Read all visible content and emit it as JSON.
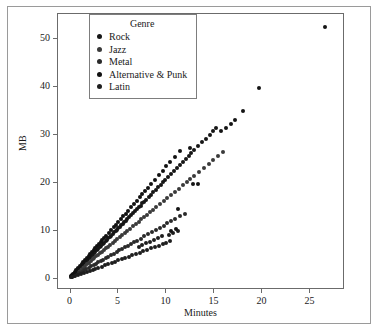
{
  "chart_data": {
    "type": "scatter",
    "title": "",
    "xlabel": "Minutes",
    "ylabel": "MB",
    "xlim": [
      -1.2,
      28.5
    ],
    "ylim": [
      -2.0,
      55.0
    ],
    "xticks": [
      0,
      5,
      10,
      15,
      20,
      25
    ],
    "yticks": [
      0,
      10,
      20,
      30,
      40,
      50
    ],
    "grid": false,
    "legend": {
      "title": "Genre",
      "position": "upper-left-inside",
      "entries": [
        {
          "label": "Rock",
          "color": "#161616"
        },
        {
          "label": "Jazz",
          "color": "#3a3a3a"
        },
        {
          "label": "Metal",
          "color": "#2a2a2a"
        },
        {
          "label": "Alternative & Punk",
          "color": "#111111"
        },
        {
          "label": "Latin",
          "color": "#1e1e1e"
        }
      ]
    },
    "series": [
      {
        "name": "Rock",
        "color": "#161616",
        "points": [
          [
            0.15,
            0.3
          ],
          [
            0.3,
            0.62
          ],
          [
            0.45,
            0.92
          ],
          [
            0.6,
            1.22
          ],
          [
            0.75,
            1.55
          ],
          [
            0.9,
            1.85
          ],
          [
            1.05,
            2.15
          ],
          [
            1.2,
            2.45
          ],
          [
            1.35,
            2.78
          ],
          [
            1.5,
            3.08
          ],
          [
            1.65,
            3.38
          ],
          [
            1.8,
            3.7
          ],
          [
            1.95,
            4.0
          ],
          [
            2.1,
            4.3
          ],
          [
            2.25,
            4.62
          ],
          [
            2.4,
            4.92
          ],
          [
            2.55,
            5.22
          ],
          [
            2.7,
            5.55
          ],
          [
            2.85,
            5.85
          ],
          [
            3.0,
            6.15
          ],
          [
            3.15,
            6.45
          ],
          [
            3.3,
            6.78
          ],
          [
            3.45,
            7.08
          ],
          [
            3.6,
            7.38
          ],
          [
            3.75,
            7.7
          ],
          [
            3.9,
            8.0
          ],
          [
            4.05,
            8.3
          ],
          [
            4.2,
            8.62
          ],
          [
            4.35,
            8.92
          ],
          [
            4.5,
            9.22
          ],
          [
            4.65,
            9.55
          ],
          [
            4.8,
            9.85
          ],
          [
            4.95,
            10.15
          ],
          [
            5.1,
            10.45
          ],
          [
            5.25,
            10.78
          ],
          [
            5.4,
            11.08
          ],
          [
            5.55,
            11.38
          ],
          [
            5.7,
            11.7
          ],
          [
            5.85,
            12.0
          ],
          [
            6.0,
            12.3
          ],
          [
            6.2,
            12.7
          ],
          [
            6.4,
            13.1
          ],
          [
            6.6,
            13.52
          ],
          [
            6.8,
            13.92
          ],
          [
            7.0,
            14.34
          ],
          [
            7.2,
            14.75
          ],
          [
            7.4,
            15.15
          ],
          [
            7.6,
            15.58
          ],
          [
            7.8,
            15.98
          ],
          [
            8.0,
            16.4
          ],
          [
            8.25,
            16.9
          ],
          [
            8.5,
            17.42
          ],
          [
            8.75,
            17.92
          ],
          [
            9.0,
            18.45
          ],
          [
            9.25,
            18.95
          ],
          [
            9.5,
            19.48
          ],
          [
            9.75,
            19.98
          ],
          [
            10.0,
            20.5
          ],
          [
            10.3,
            21.1
          ],
          [
            10.6,
            21.72
          ],
          [
            10.9,
            22.35
          ],
          [
            11.2,
            22.95
          ],
          [
            11.5,
            23.58
          ],
          [
            11.8,
            24.18
          ],
          [
            12.1,
            24.8
          ],
          [
            12.4,
            25.42
          ],
          [
            12.7,
            26.02
          ],
          [
            13.0,
            26.65
          ],
          [
            13.4,
            27.45
          ],
          [
            13.8,
            28.3
          ],
          [
            14.2,
            29.1
          ],
          [
            14.6,
            29.92
          ],
          [
            15.0,
            30.72
          ],
          [
            15.3,
            31.35
          ]
        ]
      },
      {
        "name": "Jazz",
        "color": "#3a3a3a",
        "points": [
          [
            0.2,
            0.33
          ],
          [
            0.4,
            0.66
          ],
          [
            0.6,
            0.99
          ],
          [
            0.8,
            1.31
          ],
          [
            1.0,
            1.64
          ],
          [
            1.2,
            1.97
          ],
          [
            1.4,
            2.3
          ],
          [
            1.6,
            2.62
          ],
          [
            1.8,
            2.95
          ],
          [
            2.0,
            3.28
          ],
          [
            2.2,
            3.61
          ],
          [
            2.4,
            3.93
          ],
          [
            2.6,
            4.26
          ],
          [
            2.8,
            4.59
          ],
          [
            3.0,
            4.92
          ],
          [
            3.2,
            5.25
          ],
          [
            3.4,
            5.57
          ],
          [
            3.6,
            5.9
          ],
          [
            3.8,
            6.23
          ],
          [
            4.0,
            6.56
          ],
          [
            4.25,
            6.97
          ],
          [
            4.5,
            7.38
          ],
          [
            4.75,
            7.79
          ],
          [
            5.0,
            8.2
          ],
          [
            5.25,
            8.61
          ],
          [
            5.5,
            9.02
          ],
          [
            5.75,
            9.43
          ],
          [
            6.0,
            9.84
          ],
          [
            6.3,
            10.33
          ],
          [
            6.6,
            10.82
          ],
          [
            6.9,
            11.32
          ],
          [
            7.2,
            11.81
          ],
          [
            7.5,
            12.3
          ],
          [
            7.8,
            12.79
          ],
          [
            8.1,
            13.28
          ],
          [
            8.4,
            13.78
          ],
          [
            8.7,
            14.27
          ],
          [
            9.0,
            14.76
          ],
          [
            9.4,
            15.41
          ],
          [
            9.8,
            16.07
          ],
          [
            10.2,
            16.72
          ],
          [
            10.6,
            17.38
          ],
          [
            11.0,
            18.04
          ],
          [
            11.4,
            18.69
          ],
          [
            11.8,
            19.35
          ],
          [
            12.2,
            20.0
          ],
          [
            12.6,
            20.66
          ],
          [
            13.0,
            21.32
          ],
          [
            13.5,
            22.14
          ],
          [
            14.0,
            22.96
          ],
          [
            14.5,
            23.78
          ],
          [
            15.0,
            24.6
          ],
          [
            15.5,
            25.42
          ],
          [
            16.0,
            26.24
          ]
        ]
      },
      {
        "name": "Metal",
        "color": "#2a2a2a",
        "points": [
          [
            0.25,
            0.28
          ],
          [
            0.5,
            0.56
          ],
          [
            0.75,
            0.84
          ],
          [
            1.0,
            1.12
          ],
          [
            1.25,
            1.4
          ],
          [
            1.5,
            1.68
          ],
          [
            1.75,
            1.96
          ],
          [
            2.0,
            2.24
          ],
          [
            2.25,
            2.52
          ],
          [
            2.5,
            2.8
          ],
          [
            2.75,
            3.08
          ],
          [
            3.0,
            3.36
          ],
          [
            3.25,
            3.64
          ],
          [
            3.5,
            3.92
          ],
          [
            3.75,
            4.2
          ],
          [
            4.0,
            4.48
          ],
          [
            4.3,
            4.82
          ],
          [
            4.6,
            5.15
          ],
          [
            4.9,
            5.49
          ],
          [
            5.2,
            5.82
          ],
          [
            5.5,
            6.16
          ],
          [
            5.8,
            6.5
          ],
          [
            6.1,
            6.83
          ],
          [
            6.4,
            7.17
          ],
          [
            6.7,
            7.5
          ],
          [
            7.0,
            7.84
          ],
          [
            7.4,
            8.29
          ],
          [
            7.8,
            8.74
          ],
          [
            8.2,
            9.18
          ],
          [
            8.6,
            9.63
          ],
          [
            9.0,
            10.08
          ],
          [
            9.4,
            10.53
          ],
          [
            9.8,
            10.98
          ],
          [
            10.2,
            11.42
          ],
          [
            10.6,
            11.87
          ],
          [
            11.0,
            12.32
          ],
          [
            11.5,
            12.88
          ],
          [
            12.0,
            13.44
          ]
        ]
      },
      {
        "name": "Alternative & Punk",
        "color": "#111111",
        "points": [
          [
            0.18,
            0.42
          ],
          [
            0.36,
            0.83
          ],
          [
            0.54,
            1.25
          ],
          [
            0.72,
            1.66
          ],
          [
            0.9,
            2.08
          ],
          [
            1.08,
            2.49
          ],
          [
            1.26,
            2.91
          ],
          [
            1.44,
            3.32
          ],
          [
            1.62,
            3.74
          ],
          [
            1.8,
            4.15
          ],
          [
            1.98,
            4.57
          ],
          [
            2.16,
            4.98
          ],
          [
            2.34,
            5.4
          ],
          [
            2.52,
            5.81
          ],
          [
            2.7,
            6.23
          ],
          [
            2.88,
            6.64
          ],
          [
            3.06,
            7.06
          ],
          [
            3.24,
            7.47
          ],
          [
            3.42,
            7.89
          ],
          [
            3.6,
            8.3
          ],
          [
            3.85,
            8.88
          ],
          [
            4.1,
            9.45
          ],
          [
            4.35,
            10.03
          ],
          [
            4.6,
            10.61
          ],
          [
            4.85,
            11.18
          ],
          [
            5.1,
            11.76
          ],
          [
            5.35,
            12.34
          ],
          [
            5.6,
            12.91
          ],
          [
            5.85,
            13.49
          ],
          [
            6.1,
            14.07
          ],
          [
            6.4,
            14.76
          ],
          [
            6.7,
            15.45
          ],
          [
            7.0,
            16.14
          ],
          [
            7.3,
            16.83
          ],
          [
            7.6,
            17.52
          ],
          [
            7.9,
            18.21
          ],
          [
            8.2,
            18.9
          ],
          [
            8.5,
            19.59
          ],
          [
            8.9,
            20.51
          ],
          [
            9.3,
            21.43
          ],
          [
            9.7,
            22.36
          ],
          [
            10.1,
            23.28
          ],
          [
            10.5,
            24.2
          ],
          [
            11.0,
            25.35
          ],
          [
            11.5,
            26.51
          ]
        ]
      },
      {
        "name": "Latin",
        "color": "#1e1e1e",
        "points": [
          [
            0.3,
            0.22
          ],
          [
            0.6,
            0.44
          ],
          [
            0.9,
            0.66
          ],
          [
            1.2,
            0.88
          ],
          [
            1.5,
            1.1
          ],
          [
            1.8,
            1.32
          ],
          [
            2.1,
            1.54
          ],
          [
            2.4,
            1.76
          ],
          [
            2.7,
            1.98
          ],
          [
            3.0,
            2.2
          ],
          [
            3.35,
            2.46
          ],
          [
            3.7,
            2.71
          ],
          [
            4.05,
            2.97
          ],
          [
            4.4,
            3.23
          ],
          [
            4.75,
            3.48
          ],
          [
            5.1,
            3.74
          ],
          [
            5.45,
            4.0
          ],
          [
            5.8,
            4.25
          ],
          [
            6.15,
            4.51
          ],
          [
            6.5,
            4.77
          ],
          [
            6.9,
            5.06
          ],
          [
            7.3,
            5.35
          ],
          [
            7.7,
            5.65
          ],
          [
            8.1,
            5.94
          ],
          [
            8.5,
            6.23
          ],
          [
            8.9,
            6.53
          ],
          [
            9.3,
            6.82
          ],
          [
            9.7,
            7.11
          ],
          [
            10.1,
            7.41
          ],
          [
            10.5,
            7.7
          ],
          [
            7.2,
            6.55
          ],
          [
            7.6,
            6.9
          ],
          [
            8.0,
            7.28
          ],
          [
            8.4,
            7.64
          ],
          [
            8.8,
            8.0
          ],
          [
            9.2,
            8.38
          ],
          [
            9.6,
            8.74
          ],
          [
            10.4,
            9.12
          ],
          [
            10.8,
            9.48
          ],
          [
            11.3,
            9.86
          ]
        ]
      },
      {
        "name": "outliers",
        "color": "#141414",
        "points": [
          [
            12.6,
            27.2
          ],
          [
            12.9,
            19.55
          ],
          [
            13.4,
            19.6
          ],
          [
            11.3,
            14.35
          ],
          [
            11.1,
            10.2
          ],
          [
            10.6,
            9.9
          ],
          [
            17.2,
            33.0
          ],
          [
            18.1,
            34.9
          ],
          [
            19.7,
            39.6
          ],
          [
            26.6,
            52.2
          ],
          [
            16.3,
            31.3
          ],
          [
            15.8,
            30.6
          ],
          [
            16.8,
            32.1
          ]
        ]
      }
    ]
  }
}
